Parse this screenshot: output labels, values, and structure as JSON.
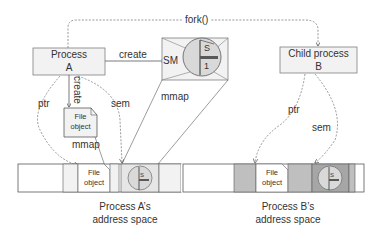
{
  "diagram": {
    "process_a": {
      "line1": "Process",
      "line2": "A"
    },
    "child_process": {
      "line1": "Child process",
      "line2": "B"
    },
    "shared_memory": {
      "label": "SM",
      "glyph_top": "S",
      "glyph_bottom": "1"
    },
    "file_object": {
      "line1": "File",
      "line2": "object"
    },
    "edges": {
      "fork": "fork()",
      "create_sm": "create",
      "create_file": "create",
      "ptr_a": "ptr",
      "sem_a": "sem",
      "mmap_file": "mmap",
      "mmap_sm": "mmap",
      "ptr_b": "ptr",
      "sem_b": "sem"
    },
    "address_space_a": {
      "line1": "Process A’s",
      "line2": "address space",
      "file_line1": "File",
      "file_line2": "object",
      "glyph": "S"
    },
    "address_space_b": {
      "line1": "Process B’s",
      "line2": "address space",
      "file_line1": "File",
      "file_line2": "object",
      "glyph": "S"
    },
    "colors": {
      "box_fill": "#f2f2f2",
      "box_stroke": "#7f7f7f",
      "shaded_fill": "#d9d9d9",
      "dark_shaded_fill": "#bfbfbf",
      "line": "#595959",
      "text": "#333333"
    }
  }
}
